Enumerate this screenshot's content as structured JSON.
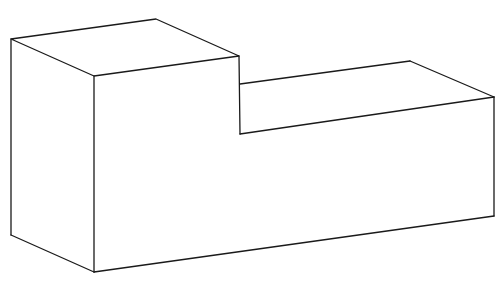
{
  "figure": {
    "background": "#ffffff",
    "stroke_color": "#1a1a1a",
    "vertices": {
      "tall_top_left": [
        11,
        39
      ],
      "tall_top_back": [
        156,
        19
      ],
      "tall_top_front": [
        94,
        76
      ],
      "tall_top_right": [
        239,
        56
      ],
      "step_inner_top": [
        240,
        84
      ],
      "step_inner_bottom": [
        240,
        134
      ],
      "step_top_back_right": [
        410,
        61
      ],
      "step_top_front_right": [
        494,
        97
      ],
      "left_bottom": [
        11,
        235
      ],
      "front_bottom": [
        94,
        272
      ],
      "right_bottom": [
        494,
        216
      ]
    }
  }
}
